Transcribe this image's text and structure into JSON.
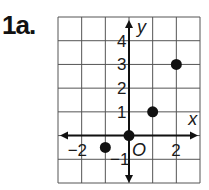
{
  "problem_label": "1a.",
  "chart_data": {
    "type": "scatter",
    "title": "",
    "xlabel": "x",
    "ylabel": "y",
    "origin_label": "O",
    "xlim": [
      -3,
      3
    ],
    "ylim": [
      -2,
      5
    ],
    "grid": true,
    "x_tick_labels": [
      "-2",
      "2"
    ],
    "y_tick_labels": [
      "4",
      "3",
      "2",
      "1",
      "-1"
    ],
    "points": [
      {
        "x": -1,
        "y": -0.5
      },
      {
        "x": 0,
        "y": 0
      },
      {
        "x": 1,
        "y": 1
      },
      {
        "x": 2,
        "y": 3
      }
    ]
  }
}
